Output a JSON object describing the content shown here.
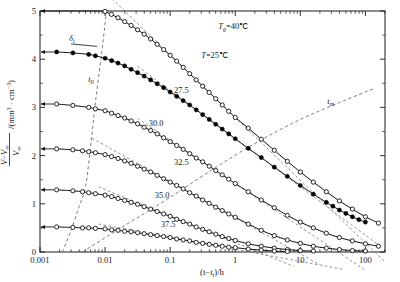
{
  "chart_data": {
    "type": "scatter",
    "title": "",
    "xlabel": "(t-t_i)/h",
    "ylabel": "(V-V∞)/V∞ /(mm³ · cm⁻³)",
    "xscale": "log",
    "yscale": "linear",
    "xlim": [
      0.001,
      200
    ],
    "ylim": [
      0,
      5
    ],
    "xticks": [
      "0.001",
      "0.01",
      "0.1",
      "1",
      "10",
      "100"
    ],
    "xtick_values": [
      0.001,
      0.01,
      0.1,
      1,
      10,
      100
    ],
    "yticks": [
      "0",
      "1",
      "2",
      "3",
      "4",
      "5"
    ],
    "ytick_values": [
      0,
      1,
      2,
      3,
      4,
      5
    ],
    "grid": false,
    "legend": "none",
    "annotations": [
      {
        "name": "glass-transition-temp",
        "text": "T",
        "sub": "g",
        "rest": "=40℃",
        "x": 0.55,
        "y": 4.62
      },
      {
        "name": "aging-temp-25",
        "text": "T",
        "sub": "",
        "rest": "=25℃",
        "x": 0.3,
        "y": 4.02
      },
      {
        "name": "delta-i-label",
        "text": "δ",
        "sub": "i",
        "rest": "",
        "x": 0.0028,
        "y": 4.38
      },
      {
        "name": "t0-label",
        "text": "t",
        "sub": "0",
        "rest": "",
        "x": 0.0055,
        "y": 3.52
      },
      {
        "name": "tm-label",
        "text": "t",
        "sub": "m",
        "rest": "",
        "x": 26,
        "y": 3.08
      }
    ],
    "series": [
      {
        "name": "T=25℃",
        "label": "T=25℃",
        "marker": "open-circle",
        "color": "#111111",
        "plateau_value": 5.0,
        "points": [
          [
            0.01,
            4.99
          ],
          [
            0.0125,
            4.93
          ],
          [
            0.0158,
            4.86
          ],
          [
            0.02,
            4.78
          ],
          [
            0.0251,
            4.7
          ],
          [
            0.0316,
            4.61
          ],
          [
            0.0398,
            4.52
          ],
          [
            0.0501,
            4.42
          ],
          [
            0.0631,
            4.31
          ],
          [
            0.0794,
            4.2
          ],
          [
            0.1,
            4.08
          ],
          [
            0.1259,
            3.96
          ],
          [
            0.1585,
            3.83
          ],
          [
            0.1995,
            3.7
          ],
          [
            0.2512,
            3.57
          ],
          [
            0.3162,
            3.44
          ],
          [
            0.3981,
            3.31
          ],
          [
            0.5012,
            3.18
          ],
          [
            0.631,
            3.05
          ],
          [
            0.7943,
            2.92
          ],
          [
            1.0,
            2.79
          ],
          [
            1.585,
            2.57
          ],
          [
            2.512,
            2.34
          ],
          [
            3.981,
            2.11
          ],
          [
            6.31,
            1.88
          ],
          [
            10.0,
            1.66
          ],
          [
            15.85,
            1.45
          ],
          [
            25.12,
            1.25
          ],
          [
            39.81,
            1.06
          ],
          [
            63.1,
            0.89
          ],
          [
            100.0,
            0.73
          ],
          [
            158.5,
            0.6
          ]
        ]
      },
      {
        "name": "27.5",
        "label": "27.5",
        "marker": "filled-circle",
        "color": "#000000",
        "plateau_value": 4.15,
        "points": [
          [
            0.0018,
            4.15
          ],
          [
            0.0032,
            4.13
          ],
          [
            0.0056,
            4.1
          ],
          [
            0.0071,
            4.07
          ],
          [
            0.01,
            4.02
          ],
          [
            0.0126,
            3.97
          ],
          [
            0.0158,
            3.92
          ],
          [
            0.02,
            3.86
          ],
          [
            0.0251,
            3.79
          ],
          [
            0.0316,
            3.72
          ],
          [
            0.0398,
            3.65
          ],
          [
            0.0501,
            3.57
          ],
          [
            0.0631,
            3.49
          ],
          [
            0.0794,
            3.41
          ],
          [
            0.1,
            3.32
          ],
          [
            0.1259,
            3.23
          ],
          [
            0.1585,
            3.14
          ],
          [
            0.1995,
            3.05
          ],
          [
            0.2512,
            2.95
          ],
          [
            0.3162,
            2.85
          ],
          [
            0.3981,
            2.75
          ],
          [
            0.5012,
            2.65
          ],
          [
            0.631,
            2.55
          ],
          [
            0.7943,
            2.45
          ],
          [
            1.0,
            2.35
          ],
          [
            1.585,
            2.15
          ],
          [
            2.512,
            1.96
          ],
          [
            3.981,
            1.76
          ],
          [
            6.31,
            1.57
          ],
          [
            10.0,
            1.38
          ],
          [
            15.85,
            1.2
          ],
          [
            25.12,
            1.03
          ],
          [
            31.62,
            0.95
          ],
          [
            39.81,
            0.87
          ],
          [
            50.12,
            0.8
          ],
          [
            63.1,
            0.73
          ],
          [
            79.43,
            0.67
          ],
          [
            100.0,
            0.62
          ]
        ]
      },
      {
        "name": "30.0",
        "label": "30.0",
        "marker": "open-circle",
        "color": "#111111",
        "plateau_value": 3.07,
        "points": [
          [
            0.0018,
            3.07
          ],
          [
            0.0032,
            3.04
          ],
          [
            0.0056,
            3.0
          ],
          [
            0.0071,
            2.97
          ],
          [
            0.01,
            2.93
          ],
          [
            0.0126,
            2.88
          ],
          [
            0.0158,
            2.83
          ],
          [
            0.02,
            2.78
          ],
          [
            0.0251,
            2.72
          ],
          [
            0.0316,
            2.66
          ],
          [
            0.0398,
            2.59
          ],
          [
            0.0501,
            2.52
          ],
          [
            0.0631,
            2.45
          ],
          [
            0.0794,
            2.37
          ],
          [
            0.1,
            2.29
          ],
          [
            0.1259,
            2.21
          ],
          [
            0.1585,
            2.13
          ],
          [
            0.1995,
            2.04
          ],
          [
            0.2512,
            1.95
          ],
          [
            0.3162,
            1.87
          ],
          [
            0.3981,
            1.78
          ],
          [
            0.5012,
            1.69
          ],
          [
            0.631,
            1.6
          ],
          [
            0.7943,
            1.51
          ],
          [
            1.0,
            1.42
          ],
          [
            1.585,
            1.25
          ],
          [
            2.512,
            1.08
          ],
          [
            3.981,
            0.92
          ],
          [
            6.31,
            0.76
          ],
          [
            10.0,
            0.62
          ],
          [
            15.85,
            0.5
          ],
          [
            25.12,
            0.39
          ],
          [
            39.81,
            0.3
          ],
          [
            63.1,
            0.23
          ],
          [
            100.0,
            0.17
          ],
          [
            158.5,
            0.12
          ]
        ]
      },
      {
        "name": "32.5",
        "label": "32.5",
        "marker": "open-circle",
        "color": "#111111",
        "plateau_value": 2.14,
        "points": [
          [
            0.0018,
            2.14
          ],
          [
            0.0032,
            2.12
          ],
          [
            0.0045,
            2.1
          ],
          [
            0.0056,
            2.08
          ],
          [
            0.0071,
            2.06
          ],
          [
            0.01,
            2.02
          ],
          [
            0.0126,
            1.98
          ],
          [
            0.0158,
            1.94
          ],
          [
            0.02,
            1.89
          ],
          [
            0.0251,
            1.84
          ],
          [
            0.0316,
            1.78
          ],
          [
            0.0398,
            1.72
          ],
          [
            0.0501,
            1.66
          ],
          [
            0.0631,
            1.59
          ],
          [
            0.0794,
            1.52
          ],
          [
            0.1,
            1.45
          ],
          [
            0.1259,
            1.38
          ],
          [
            0.1585,
            1.31
          ],
          [
            0.1995,
            1.23
          ],
          [
            0.2512,
            1.16
          ],
          [
            0.3162,
            1.08
          ],
          [
            0.3981,
            1.01
          ],
          [
            0.5012,
            0.93
          ],
          [
            0.631,
            0.86
          ],
          [
            0.7943,
            0.79
          ],
          [
            1.0,
            0.72
          ],
          [
            1.585,
            0.58
          ],
          [
            2.512,
            0.45
          ],
          [
            3.981,
            0.34
          ],
          [
            6.31,
            0.25
          ],
          [
            10.0,
            0.18
          ],
          [
            15.85,
            0.12
          ],
          [
            25.12,
            0.08
          ],
          [
            39.81,
            0.05
          ],
          [
            63.1,
            0.03
          ],
          [
            100.0,
            0.02
          ]
        ]
      },
      {
        "name": "35.0",
        "label": "35.0",
        "marker": "open-circle",
        "color": "#111111",
        "plateau_value": 1.29,
        "points": [
          [
            0.0018,
            1.29
          ],
          [
            0.0032,
            1.27
          ],
          [
            0.0045,
            1.25
          ],
          [
            0.0056,
            1.23
          ],
          [
            0.0071,
            1.21
          ],
          [
            0.01,
            1.18
          ],
          [
            0.0126,
            1.15
          ],
          [
            0.0158,
            1.11
          ],
          [
            0.02,
            1.07
          ],
          [
            0.0251,
            1.03
          ],
          [
            0.0316,
            0.99
          ],
          [
            0.0398,
            0.94
          ],
          [
            0.0501,
            0.89
          ],
          [
            0.0631,
            0.84
          ],
          [
            0.0794,
            0.79
          ],
          [
            0.1,
            0.74
          ],
          [
            0.1259,
            0.68
          ],
          [
            0.1585,
            0.63
          ],
          [
            0.1995,
            0.58
          ],
          [
            0.2512,
            0.52
          ],
          [
            0.3162,
            0.47
          ],
          [
            0.3981,
            0.42
          ],
          [
            0.5012,
            0.37
          ],
          [
            0.631,
            0.32
          ],
          [
            0.7943,
            0.28
          ],
          [
            1.0,
            0.24
          ],
          [
            1.585,
            0.17
          ],
          [
            2.512,
            0.12
          ],
          [
            3.981,
            0.08
          ],
          [
            6.31,
            0.05
          ],
          [
            10.0,
            0.03
          ],
          [
            15.85,
            0.02
          ]
        ]
      },
      {
        "name": "37.5",
        "label": "37.5",
        "marker": "open-circle",
        "color": "#111111",
        "plateau_value": 0.52,
        "points": [
          [
            0.0018,
            0.52
          ],
          [
            0.0032,
            0.51
          ],
          [
            0.0045,
            0.5
          ],
          [
            0.0056,
            0.5
          ],
          [
            0.0071,
            0.49
          ],
          [
            0.01,
            0.48
          ],
          [
            0.0126,
            0.46
          ],
          [
            0.0158,
            0.45
          ],
          [
            0.02,
            0.43
          ],
          [
            0.0251,
            0.42
          ],
          [
            0.0316,
            0.4
          ],
          [
            0.0398,
            0.38
          ],
          [
            0.0501,
            0.36
          ],
          [
            0.0631,
            0.34
          ],
          [
            0.0794,
            0.32
          ],
          [
            0.1,
            0.3
          ],
          [
            0.1259,
            0.27
          ],
          [
            0.1585,
            0.25
          ],
          [
            0.1995,
            0.23
          ],
          [
            0.2512,
            0.2
          ],
          [
            0.3162,
            0.18
          ],
          [
            0.3981,
            0.16
          ],
          [
            0.5012,
            0.14
          ],
          [
            0.631,
            0.12
          ],
          [
            0.7943,
            0.1
          ],
          [
            1.0,
            0.09
          ],
          [
            1.585,
            0.06
          ],
          [
            2.512,
            0.04
          ],
          [
            3.981,
            0.02
          ],
          [
            6.31,
            0.01
          ]
        ]
      }
    ],
    "series_labels": [
      {
        "name": "label-25",
        "text": "T=25℃",
        "x": 0.3,
        "y": 4.02
      },
      {
        "name": "label-275",
        "text": "27.5",
        "x": 0.115,
        "y": 3.3
      },
      {
        "name": "label-300",
        "text": "30.0",
        "x": 0.047,
        "y": 2.62
      },
      {
        "name": "label-325",
        "text": "32.5",
        "x": 0.115,
        "y": 1.8
      },
      {
        "name": "label-350",
        "text": "35.0",
        "x": 0.058,
        "y": 1.12
      },
      {
        "name": "label-375",
        "text": "37.5",
        "x": 0.072,
        "y": 0.52
      }
    ],
    "tm_locus_points": [
      [
        0.0045,
        0.0
      ],
      [
        0.02,
        0.55
      ],
      [
        0.08,
        1.05
      ],
      [
        0.35,
        1.62
      ],
      [
        2.0,
        2.25
      ],
      [
        10.0,
        2.75
      ],
      [
        40.0,
        3.1
      ],
      [
        140.0,
        3.4
      ]
    ],
    "t0_locus_points": [
      [
        0.0022,
        0.0
      ],
      [
        0.003,
        0.45
      ],
      [
        0.004,
        0.95
      ],
      [
        0.005,
        1.35
      ],
      [
        0.006,
        2.2
      ],
      [
        0.0072,
        3.17
      ],
      [
        0.009,
        4.2
      ],
      [
        0.0105,
        5.0
      ]
    ]
  },
  "axes": {
    "xlabel_parts": {
      "pre": "(t",
      "minus": "−",
      "t": "t",
      "sub": "i",
      "post": ")/h"
    },
    "ylabel_parts": {
      "num_v": "V",
      "minus": "−",
      "num_vinf": "V",
      "num_vinf_sub": "∞",
      "den_v": "V",
      "den_sub": "∞",
      "units": "/(mm",
      "units_sup1": "3",
      "units_mid": " · cm",
      "units_sup2": "−3",
      "units_end": ")"
    }
  }
}
